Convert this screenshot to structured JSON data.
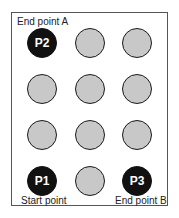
{
  "labels": {
    "top_left": "End point A",
    "bottom_left": "Start point",
    "bottom_right": "End point B"
  },
  "grid": {
    "rows": 4,
    "cols": 3,
    "cells": [
      {
        "row": 0,
        "col": 0,
        "label": "P2",
        "active": true
      },
      {
        "row": 0,
        "col": 1,
        "label": "",
        "active": false
      },
      {
        "row": 0,
        "col": 2,
        "label": "",
        "active": false
      },
      {
        "row": 1,
        "col": 0,
        "label": "",
        "active": false
      },
      {
        "row": 1,
        "col": 1,
        "label": "",
        "active": false
      },
      {
        "row": 1,
        "col": 2,
        "label": "",
        "active": false
      },
      {
        "row": 2,
        "col": 0,
        "label": "",
        "active": false
      },
      {
        "row": 2,
        "col": 1,
        "label": "",
        "active": false
      },
      {
        "row": 2,
        "col": 2,
        "label": "",
        "active": false
      },
      {
        "row": 3,
        "col": 0,
        "label": "P1",
        "active": true
      },
      {
        "row": 3,
        "col": 1,
        "label": "",
        "active": false
      },
      {
        "row": 3,
        "col": 2,
        "label": "P3",
        "active": true
      }
    ]
  },
  "colors": {
    "active": "#111111",
    "inactive": "#c8c8c8",
    "outline": "#1a1a1a"
  }
}
